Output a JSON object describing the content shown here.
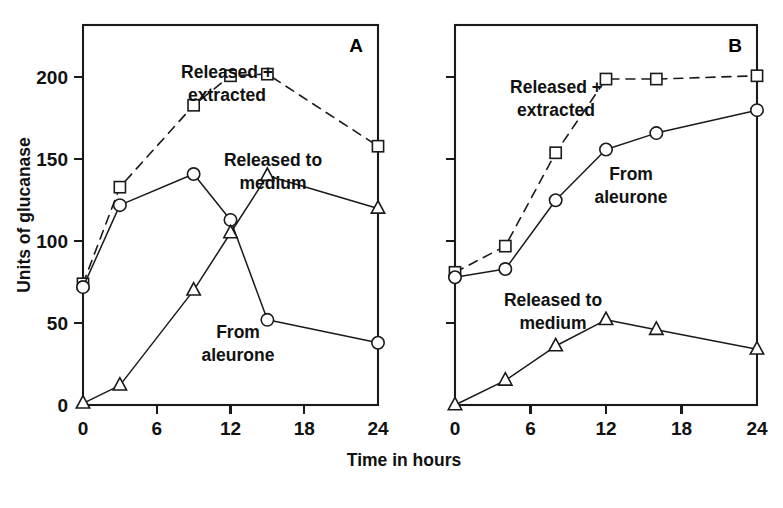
{
  "figure": {
    "ylabel": "Units of glucanase",
    "xlabel": "Time in hours"
  },
  "panels": {
    "a": {
      "letter": "A",
      "labels": {
        "released_extracted_line1": "Released +",
        "released_extracted_line2": "extracted",
        "released_medium_line1": "Released to",
        "released_medium_line2": "medium",
        "from_aleurone_line1": "From",
        "from_aleurone_line2": "aleurone"
      }
    },
    "b": {
      "letter": "B",
      "labels": {
        "released_extracted_line1": "Released +",
        "released_extracted_line2": "extracted",
        "from_aleurone_line1": "From",
        "from_aleurone_line2": "aleurone",
        "released_medium_line1": "Released to",
        "released_medium_line2": "medium"
      }
    }
  },
  "axes": {
    "y_ticks": [
      0,
      50,
      100,
      150,
      200
    ],
    "y_tick_labels": [
      "0",
      "50",
      "100",
      "150",
      "200"
    ],
    "x_ticks": [
      0,
      6,
      12,
      18,
      24
    ],
    "x_tick_labels": [
      "0",
      "6",
      "12",
      "18",
      "24"
    ],
    "xlim": [
      0,
      24
    ],
    "ylim": [
      0,
      232
    ]
  },
  "chart_data": [
    {
      "type": "line",
      "panel": "A",
      "title": "A",
      "xlabel": "Time in hours",
      "ylabel": "Units of glucanase",
      "xlim": [
        0,
        24
      ],
      "ylim": [
        0,
        232
      ],
      "xticks": [
        0,
        6,
        12,
        18,
        24
      ],
      "yticks": [
        0,
        50,
        100,
        150,
        200
      ],
      "grid": false,
      "legend": "inline-annotations",
      "series": [
        {
          "name": "Released + extracted",
          "marker": "square",
          "linestyle": "dashed",
          "x": [
            0,
            3,
            9,
            12,
            15,
            24
          ],
          "values": [
            74,
            133,
            183,
            201,
            202,
            158
          ]
        },
        {
          "name": "From aleurone",
          "marker": "circle",
          "linestyle": "solid",
          "x": [
            0,
            3,
            9,
            12,
            15,
            24
          ],
          "values": [
            72,
            122,
            141,
            113,
            52,
            38
          ]
        },
        {
          "name": "Released to medium",
          "marker": "triangle",
          "linestyle": "solid",
          "x": [
            0,
            3,
            9,
            12,
            15,
            24
          ],
          "values": [
            1,
            12,
            70,
            105,
            140,
            120
          ]
        }
      ]
    },
    {
      "type": "line",
      "panel": "B",
      "title": "B",
      "xlabel": "Time in hours",
      "ylabel": "Units of glucanase",
      "xlim": [
        0,
        24
      ],
      "ylim": [
        0,
        232
      ],
      "xticks": [
        0,
        6,
        12,
        18,
        24
      ],
      "yticks": [
        0,
        50,
        100,
        150,
        200
      ],
      "grid": false,
      "legend": "inline-annotations",
      "series": [
        {
          "name": "Released + extracted",
          "marker": "square",
          "linestyle": "dashed",
          "x": [
            0,
            4,
            8,
            12,
            16,
            24
          ],
          "values": [
            81,
            97,
            154,
            199,
            199,
            201
          ]
        },
        {
          "name": "From aleurone",
          "marker": "circle",
          "linestyle": "solid",
          "x": [
            0,
            4,
            8,
            12,
            16,
            24
          ],
          "values": [
            78,
            83,
            125,
            156,
            166,
            180
          ]
        },
        {
          "name": "Released to medium",
          "marker": "triangle",
          "linestyle": "solid",
          "x": [
            0,
            4,
            8,
            12,
            16,
            24
          ],
          "values": [
            0,
            15,
            36,
            52,
            46,
            34
          ]
        }
      ]
    }
  ]
}
